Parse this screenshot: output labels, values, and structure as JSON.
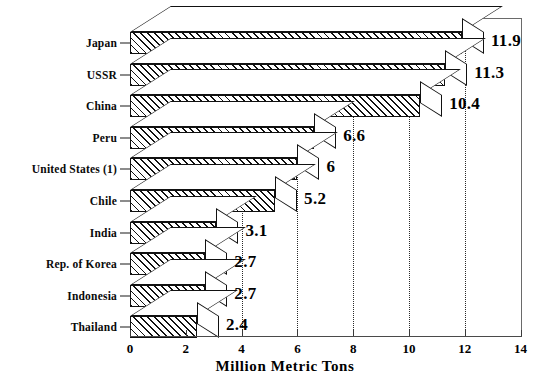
{
  "chart_data": {
    "type": "bar",
    "orientation": "horizontal",
    "title": "",
    "xlabel": "Million Metric Tons",
    "ylabel": "",
    "xlim": [
      0,
      14
    ],
    "xticks": [
      "0",
      "2",
      "4",
      "6",
      "8",
      "10",
      "12",
      "14"
    ],
    "xtick_values": [
      0,
      2,
      4,
      6,
      8,
      10,
      12,
      14
    ],
    "grid": "vertical dotted gridlines at 4, 6, 8, 10, 12",
    "gridline_values": [
      4,
      6,
      8,
      10,
      12
    ],
    "legend": "none",
    "style": "3D extruded bars with diagonal hatch fill",
    "categories": [
      "Japan",
      "USSR",
      "China",
      "Peru",
      "United States (1)",
      "Chile",
      "India",
      "Rep. of Korea",
      "Indonesia",
      "Thailand"
    ],
    "values": [
      11.9,
      11.3,
      10.4,
      6.6,
      6,
      5.2,
      3.1,
      2.7,
      2.7,
      2.4
    ],
    "data_labels": [
      "11.9",
      "11.3",
      "10.4",
      "6.6",
      "6",
      "5.2",
      "3.1",
      "2.7",
      "2.7",
      "2.4"
    ]
  },
  "figure": {
    "axis_title": "Million Metric Tons",
    "caption": ""
  }
}
